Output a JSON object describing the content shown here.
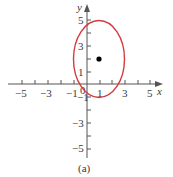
{
  "figure": {
    "caption": "(a)",
    "x_axis_label": "x",
    "y_axis_label": "y",
    "origin_label": "0"
  },
  "x_ticks": {
    "labels": [
      "−5",
      "−3",
      "−1",
      "1",
      "3",
      "5"
    ],
    "values": [
      -5,
      -3,
      -1,
      1,
      3,
      5
    ]
  },
  "y_ticks": {
    "labels": [
      "5",
      "3",
      "1",
      "−1",
      "−3",
      "−5"
    ],
    "values": [
      5,
      3,
      1,
      -1,
      -3,
      -5
    ]
  },
  "ellipse": {
    "center": [
      1,
      2
    ],
    "semi_axis_x": 2,
    "semi_axis_y": 3,
    "color": "#d43a3f"
  },
  "center_point": {
    "x": 1,
    "y": 2,
    "color": "#000000"
  }
}
